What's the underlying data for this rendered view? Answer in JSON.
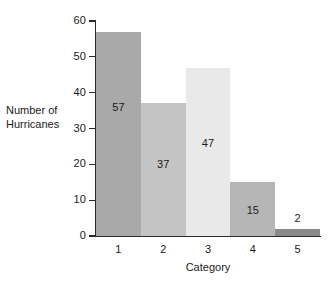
{
  "chart_data": {
    "type": "bar",
    "title": "",
    "xlabel": "Category",
    "ylabel_lines": [
      "Number of",
      "Hurricanes"
    ],
    "ylabel": "Number of Hurricanes",
    "categories": [
      "1",
      "2",
      "3",
      "4",
      "5"
    ],
    "values": [
      57,
      37,
      47,
      15,
      2
    ],
    "value_labels": [
      "57",
      "37",
      "47",
      "15",
      "2"
    ],
    "ylim": [
      0,
      60
    ],
    "yticks": [
      0,
      10,
      20,
      30,
      40,
      50,
      60
    ],
    "ytick_labels": [
      "0",
      "10",
      "20",
      "30",
      "40",
      "50",
      "60"
    ],
    "grid": false,
    "legend": false,
    "bar_colors": [
      "#a9a9a9",
      "#c4c4c4",
      "#e9e9e9",
      "#b6b6b6",
      "#8a8a8a"
    ],
    "axis_color": "#2b2b2b",
    "background": "#ffffff",
    "label_placement": [
      "inside",
      "inside",
      "inside",
      "inside",
      "above"
    ]
  }
}
